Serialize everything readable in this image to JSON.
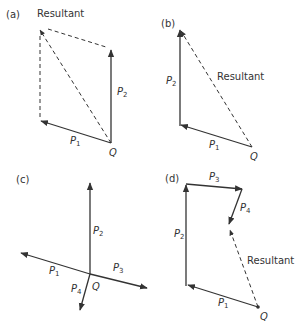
{
  "panels": {
    "a": {
      "label": "(a)",
      "resultant_label": "Resultant",
      "p1": "P",
      "p1_sub": "1",
      "p2": "P",
      "p2_sub": "2",
      "origin": "Q"
    },
    "b": {
      "label": "(b)",
      "resultant_label": "Resultant",
      "p1": "P",
      "p1_sub": "1",
      "p2": "P",
      "p2_sub": "2",
      "origin": "Q"
    },
    "c": {
      "label": "(c)",
      "p1": "P",
      "p1_sub": "1",
      "p2": "P",
      "p2_sub": "2",
      "p3": "P",
      "p3_sub": "3",
      "p4": "P",
      "p4_sub": "4",
      "origin": "Q"
    },
    "d": {
      "label": "(d)",
      "resultant_label": "Resultant",
      "p1": "P",
      "p1_sub": "1",
      "p2": "P",
      "p2_sub": "2",
      "p3": "P",
      "p3_sub": "3",
      "p4": "P",
      "p4_sub": "4",
      "origin": "Q"
    }
  },
  "colors": {
    "stroke": "#333333",
    "background": "#ffffff"
  }
}
